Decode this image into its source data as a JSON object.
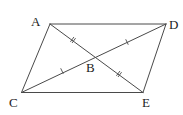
{
  "diagram": {
    "type": "geometry",
    "colors": {
      "line": "#4a4a4a",
      "label": "#222222",
      "background": "#ffffff"
    },
    "points": {
      "A": {
        "label": "A",
        "x": 50,
        "y": 24,
        "label_x": 31,
        "label_y": 26
      },
      "D": {
        "label": "D",
        "x": 166,
        "y": 24,
        "label_x": 169,
        "label_y": 29
      },
      "C": {
        "label": "C",
        "x": 21.5,
        "y": 92.5,
        "label_x": 9,
        "label_y": 107
      },
      "E": {
        "label": "E",
        "x": 143,
        "y": 92.5,
        "label_x": 142,
        "label_y": 107
      },
      "B": {
        "label": "B",
        "x": 95.5,
        "y": 57,
        "label_x": 86,
        "label_y": 72
      }
    },
    "segments": [
      {
        "from": "A",
        "to": "D"
      },
      {
        "from": "A",
        "to": "C"
      },
      {
        "from": "C",
        "to": "E"
      },
      {
        "from": "E",
        "to": "D"
      },
      {
        "from": "A",
        "to": "E"
      },
      {
        "from": "C",
        "to": "D"
      }
    ],
    "tick_marks": [
      {
        "segment": "AB",
        "count": 2,
        "x": 73,
        "y": 40
      },
      {
        "segment": "BE",
        "count": 2,
        "x": 119,
        "y": 74
      },
      {
        "segment": "CB",
        "count": 1,
        "x": 62,
        "y": 71
      },
      {
        "segment": "BD",
        "count": 1,
        "x": 127,
        "y": 42
      }
    ]
  }
}
